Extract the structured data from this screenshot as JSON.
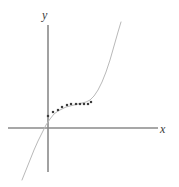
{
  "figure": {
    "name": "cubic-curve-with-data-points",
    "background_color": "#ffffff"
  },
  "axes": {
    "x_label": "x",
    "y_label": "y",
    "axis_color": "#8a8a8a",
    "axis_stroke_width": 1.6,
    "x_axis": {
      "x1": 8,
      "y1": 128,
      "x2": 158,
      "y2": 128
    },
    "y_axis": {
      "x1": 48,
      "y1": 25,
      "x2": 48,
      "y2": 172
    },
    "origin": {
      "x": 48,
      "y": 128
    }
  },
  "chart_data": {
    "type": "scatter",
    "title": "",
    "xlabel": "x",
    "ylabel": "y",
    "grid": false,
    "legend": null,
    "xlim": [
      -1.6,
      3.7
    ],
    "ylim": [
      -1.9,
      3.7
    ],
    "series": [
      {
        "name": "curve",
        "type": "line",
        "color": "#b9b9b9",
        "stroke_width": 1.0,
        "comment": "smooth increasing cubic-like curve through the origin region, flat near middle then steeply rising",
        "points_px": [
          [
            22,
            180
          ],
          [
            26,
            170
          ],
          [
            30,
            160
          ],
          [
            34,
            150
          ],
          [
            38,
            141
          ],
          [
            42,
            133
          ],
          [
            46,
            125
          ],
          [
            50,
            119
          ],
          [
            54,
            114
          ],
          [
            58,
            111
          ],
          [
            62,
            109
          ],
          [
            66,
            107
          ],
          [
            70,
            106
          ],
          [
            74,
            105
          ],
          [
            78,
            104
          ],
          [
            82,
            103
          ],
          [
            86,
            102
          ],
          [
            90,
            100
          ],
          [
            94,
            96
          ],
          [
            98,
            90
          ],
          [
            102,
            82
          ],
          [
            106,
            72
          ],
          [
            110,
            60
          ],
          [
            114,
            46
          ],
          [
            118,
            32
          ],
          [
            121,
            22
          ]
        ]
      },
      {
        "name": "data-points",
        "type": "scatter",
        "color": "#3c3c3c",
        "marker": "square",
        "marker_size_px": 2.2,
        "count": 11,
        "points_px": [
          [
            48,
            116
          ],
          [
            53,
            112
          ],
          [
            58,
            110
          ],
          [
            62,
            107
          ],
          [
            67,
            105
          ],
          [
            71,
            104
          ],
          [
            76,
            104
          ],
          [
            80,
            104
          ],
          [
            84,
            104
          ],
          [
            88,
            104
          ],
          [
            91,
            102
          ]
        ]
      }
    ]
  }
}
